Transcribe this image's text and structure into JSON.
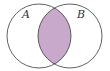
{
  "diagram": {
    "type": "venn",
    "sets": [
      {
        "label": "A",
        "cx": 39,
        "cy": 36,
        "r": 32
      },
      {
        "label": "B",
        "cx": 70,
        "cy": 36,
        "r": 32
      }
    ],
    "highlighted_region": "A ∩ B",
    "colors": {
      "fill": "#c8a9cb",
      "stroke": "#3a3a3a",
      "background": "#ffffff"
    }
  }
}
